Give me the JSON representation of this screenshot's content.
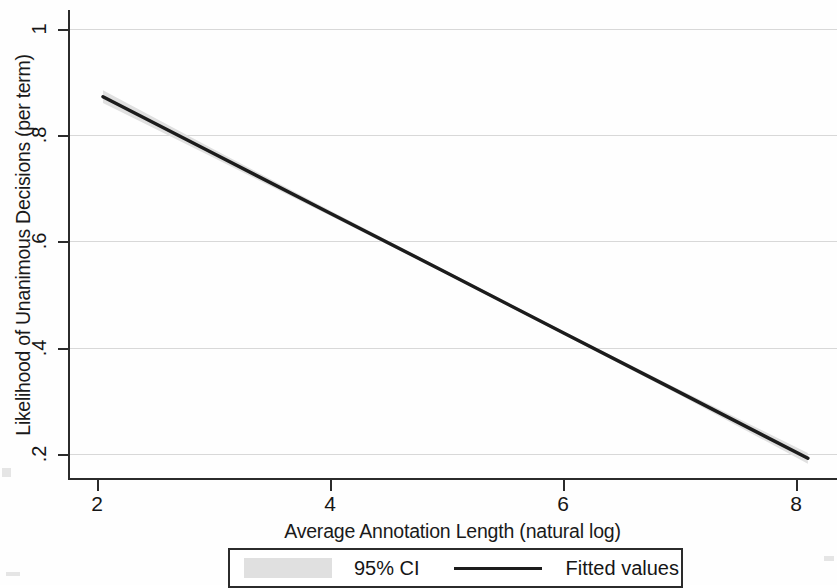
{
  "chart_data": {
    "type": "line",
    "title": "",
    "subtitle": "",
    "xlabel": "Average Annotation Length (natural log)",
    "ylabel": "Likelihood of Unanimous Decisions (per term)",
    "xlim": [
      1.75,
      8.35
    ],
    "ylim": [
      0.155,
      1.035
    ],
    "xticks": [
      2,
      4,
      6,
      8
    ],
    "xticklabels": [
      "2",
      "4",
      "6",
      "8"
    ],
    "yticks": [
      0.2,
      0.4,
      0.6,
      0.8,
      1
    ],
    "yticklabels": [
      ".2",
      ".4",
      ".6",
      ".8",
      "1"
    ],
    "grid": "horizontal",
    "legend_position": "below-axes",
    "series": [
      {
        "name": "Fitted values",
        "type": "line",
        "color": "#1c1c1c",
        "x": [
          2.05,
          3.0,
          4.0,
          5.0,
          6.0,
          7.0,
          8.1
        ],
        "y": [
          0.872,
          0.765,
          0.653,
          0.541,
          0.428,
          0.316,
          0.192
        ]
      },
      {
        "name": "95% CI",
        "type": "band",
        "color": "#e0e0e0",
        "x": [
          2.05,
          3.0,
          4.0,
          5.0,
          6.0,
          7.0,
          8.1
        ],
        "y_low": [
          0.86,
          0.757,
          0.648,
          0.538,
          0.425,
          0.311,
          0.182
        ],
        "y_high": [
          0.884,
          0.773,
          0.658,
          0.544,
          0.431,
          0.321,
          0.202
        ]
      }
    ],
    "legend": [
      {
        "label": "95% CI",
        "marker": "patch",
        "color": "#e0e0e0"
      },
      {
        "label": "Fitted values",
        "marker": "line",
        "color": "#1c1c1c"
      }
    ]
  },
  "axes": {
    "y_title": "Likelihood of Unanimous Decisions (per term)",
    "x_title": "Average Annotation Length (natural log)",
    "y_tick_labels": [
      "1",
      ".8",
      ".6",
      ".4",
      ".2"
    ],
    "x_tick_labels": [
      "2",
      "4",
      "6",
      "8"
    ]
  },
  "legend": {
    "ci_label": "95% CI",
    "fitted_label": "Fitted values"
  },
  "colors": {
    "line": "#1c1c1c",
    "band": "#e0e0e0",
    "grid": "#d8d8d8",
    "axis": "#2b2b2b",
    "text": "#161616",
    "background": "#fefefe"
  }
}
